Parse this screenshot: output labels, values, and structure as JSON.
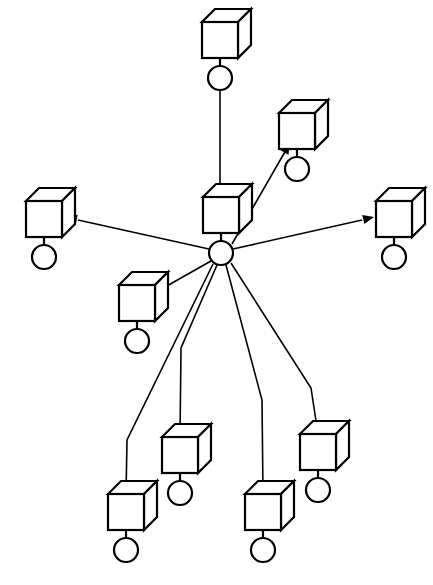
{
  "diagram": {
    "type": "node-link-diagram",
    "background_color": "#ffffff",
    "stroke_color": "#000000",
    "canvas": {
      "width": 433,
      "height": 585
    },
    "node_glyph": {
      "shape": "cube-on-circle",
      "description": "Isometric wireframe cube resting above a small circle, joined by a short vertical stem",
      "cube_face_width": 36,
      "cube_depth": 13,
      "circle_radius": 12
    },
    "nodes": [
      {
        "id": "hub",
        "name": "center-hub-node",
        "role": "hub",
        "x": 221,
        "y": 215,
        "circle_x": 221,
        "circle_y": 253
      },
      {
        "id": "n-top",
        "name": "top-node",
        "role": "spoke",
        "x": 220,
        "y": 40,
        "circle_x": 220,
        "circle_y": 78
      },
      {
        "id": "n-upper-right",
        "name": "upper-right-node",
        "role": "spoke",
        "x": 297,
        "y": 131,
        "circle_x": 297,
        "circle_y": 169
      },
      {
        "id": "n-left",
        "name": "left-node",
        "role": "spoke",
        "x": 44,
        "y": 219,
        "circle_x": 44,
        "circle_y": 257
      },
      {
        "id": "n-right",
        "name": "right-node",
        "role": "spoke",
        "x": 394,
        "y": 219,
        "circle_x": 394,
        "circle_y": 257
      },
      {
        "id": "n-lower-left",
        "name": "lower-left-node",
        "role": "spoke",
        "x": 137,
        "y": 303,
        "circle_x": 137,
        "circle_y": 341
      },
      {
        "id": "n-bottom-1",
        "name": "bottom-node-one",
        "role": "spoke",
        "x": 126,
        "y": 512,
        "circle_x": 126,
        "circle_y": 550
      },
      {
        "id": "n-bottom-2",
        "name": "bottom-node-two",
        "role": "spoke",
        "x": 180,
        "y": 455,
        "circle_x": 180,
        "circle_y": 493
      },
      {
        "id": "n-bottom-3",
        "name": "bottom-node-three",
        "role": "spoke",
        "x": 263,
        "y": 512,
        "circle_x": 263,
        "circle_y": 550
      },
      {
        "id": "n-bottom-4",
        "name": "bottom-node-four",
        "role": "spoke",
        "x": 318,
        "y": 452,
        "circle_x": 318,
        "circle_y": 490
      }
    ],
    "edges": [
      {
        "id": "e-top-to-hub",
        "name": "edge-top-to-hub",
        "from": "n-top",
        "to": "hub",
        "directed": true,
        "arrow_at": "hub",
        "path": "M 220 91 L 220 196",
        "arrow": {
          "x": 220,
          "y": 205,
          "angle": 90
        }
      },
      {
        "id": "e-hub-to-upper-right",
        "name": "edge-hub-to-upper-right",
        "from": "hub",
        "to": "n-upper-right",
        "directed": true,
        "arrow_at": "n-upper-right",
        "path": "M 232 244 L 286 150",
        "arrow": {
          "x": 290,
          "y": 143,
          "angle": -60
        }
      },
      {
        "id": "e-hub-to-left",
        "name": "edge-hub-to-left",
        "from": "hub",
        "to": "n-left",
        "directed": true,
        "arrow_at": "n-left",
        "path": "M 209 249 L 78 220",
        "arrow": {
          "x": 66,
          "y": 217,
          "angle": 192
        }
      },
      {
        "id": "e-hub-to-right",
        "name": "edge-hub-to-right",
        "from": "hub",
        "to": "n-right",
        "directed": true,
        "arrow_at": "n-right",
        "path": "M 233 249 L 362 220",
        "arrow": {
          "x": 374,
          "y": 217,
          "angle": 347
        }
      },
      {
        "id": "e-hub-to-lower-left",
        "name": "edge-hub-to-lower-left",
        "from": "hub",
        "to": "n-lower-left",
        "directed": false,
        "arrow_at": "none",
        "path": "M 211 261 L 158 291"
      },
      {
        "id": "e-hub-to-bottom-1",
        "name": "edge-hub-to-bottom-one",
        "from": "hub",
        "to": "n-bottom-1",
        "directed": true,
        "arrow_at": "n-bottom-1",
        "path": "M 213 264 L 127 440 L 126 494",
        "arrow": {
          "x": 126,
          "y": 503,
          "angle": 90
        }
      },
      {
        "id": "e-hub-to-bottom-2",
        "name": "edge-hub-to-bottom-two",
        "from": "hub",
        "to": "n-bottom-2",
        "directed": true,
        "arrow_at": "n-bottom-2",
        "path": "M 217 265 L 181 348 L 180 437",
        "arrow": {
          "x": 180,
          "y": 446,
          "angle": 90
        }
      },
      {
        "id": "e-hub-to-bottom-3",
        "name": "edge-hub-to-bottom-three",
        "from": "hub",
        "to": "n-bottom-3",
        "directed": true,
        "arrow_at": "n-bottom-3",
        "path": "M 226 265 L 262 400 L 263 494",
        "arrow": {
          "x": 263,
          "y": 503,
          "angle": 90
        }
      },
      {
        "id": "e-hub-to-bottom-4",
        "name": "edge-hub-to-bottom-four",
        "from": "hub",
        "to": "n-bottom-4",
        "directed": true,
        "arrow_at": "n-bottom-4",
        "path": "M 231 263 L 311 388 L 318 434",
        "arrow": {
          "x": 318,
          "y": 443,
          "angle": 90
        }
      }
    ],
    "counts": {
      "total_nodes": 10,
      "spoke_nodes": 9,
      "hub_nodes": 1,
      "edges": 9
    }
  }
}
